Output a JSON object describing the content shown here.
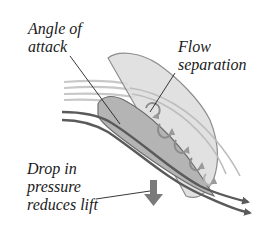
{
  "diagram": {
    "labels": {
      "angle_of_attack": {
        "line1": "Angle of",
        "line2": "attack"
      },
      "flow_separation": {
        "line1": "Flow",
        "line2": "separation"
      },
      "drop_in_pressure": {
        "line1": "Drop in",
        "line2": "pressure",
        "line3": "reduces lift"
      }
    },
    "colors": {
      "airfoil_fill": "#b4b4b4",
      "airfoil_stroke": "#6e6e6e",
      "separation_region_fill": "#d6d6d6",
      "streamline_dark": "#5a5a5a",
      "streamline_light": "#c8c8c8",
      "vortex": "#8c8c8c",
      "down_arrow": "#7a7a7a",
      "leader_line": "#222222",
      "text": "#1a1a1a"
    }
  }
}
